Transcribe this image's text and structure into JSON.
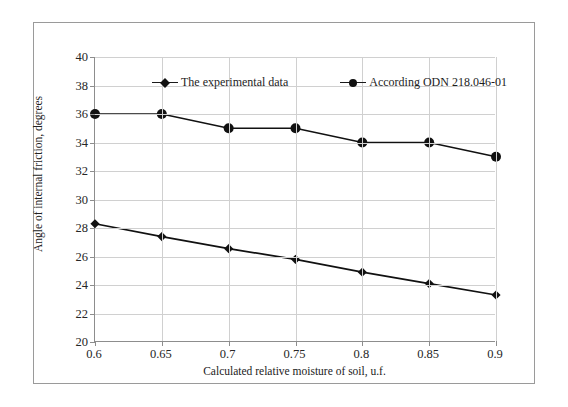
{
  "chart_data": {
    "type": "line",
    "title": "",
    "xlabel": "Calculated relative moisture of soil, u.f.",
    "ylabel": "Angle of internal friction, degrees",
    "x": [
      0.6,
      0.65,
      0.7,
      0.75,
      0.8,
      0.85,
      0.9
    ],
    "xtick_labels": [
      "0.6",
      "0.65",
      "0.7",
      "0.75",
      "0.8",
      "0.85",
      "0.9"
    ],
    "ytick_labels": [
      "20",
      "22",
      "24",
      "26",
      "28",
      "30",
      "32",
      "34",
      "36",
      "38",
      "40"
    ],
    "yticks": [
      20,
      22,
      24,
      26,
      28,
      30,
      32,
      34,
      36,
      38,
      40
    ],
    "xlim": [
      0.6,
      0.9
    ],
    "ylim": [
      20,
      40
    ],
    "grid": true,
    "legend_position": "top-center",
    "series": [
      {
        "name": "The experimental data",
        "marker": "diamond",
        "color": "#111111",
        "values": [
          28.3,
          27.4,
          26.55,
          25.8,
          24.9,
          24.1,
          23.3
        ]
      },
      {
        "name": "According ODN 218.046-01",
        "marker": "circle",
        "color": "#111111",
        "values": [
          36,
          36,
          35,
          35,
          34,
          34,
          33
        ]
      }
    ]
  },
  "legend": {
    "entries": [
      {
        "label": "The experimental data",
        "marker": "diamond"
      },
      {
        "label": "According ODN 218.046-01",
        "marker": "circle"
      }
    ]
  },
  "axes": {
    "x_title": "Calculated relative moisture of soil, u.f.",
    "y_title": "Angle of internal friction, degrees"
  }
}
